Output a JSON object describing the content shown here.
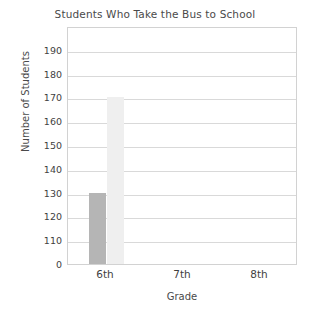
{
  "chart_data": {
    "type": "bar",
    "title": "Students Who Take the Bus to School",
    "xlabel": "Grade",
    "ylabel": "Number of Students",
    "categories": [
      "6th",
      "7th",
      "8th"
    ],
    "series": [
      {
        "name": "series-1",
        "color": "#b5b5b5",
        "values": [
          130,
          0,
          0
        ]
      },
      {
        "name": "series-2",
        "color": "#efefef",
        "values": [
          170,
          0,
          0
        ]
      }
    ],
    "ytick_labels": [
      "190",
      "180",
      "170",
      "160",
      "150",
      "140",
      "130",
      "120",
      "110",
      "0"
    ],
    "ytick_values": [
      190,
      180,
      170,
      160,
      150,
      140,
      130,
      120,
      110,
      0
    ],
    "ylim": [
      100,
      200
    ],
    "grid": "horizontal",
    "legend": "none",
    "axis_note": "value axis breaks between 110 and 0"
  },
  "colors": {
    "frame": "#d2d2d2",
    "gridline": "#d9d9d9",
    "text": "#3f3f3f",
    "background": "#ffffff"
  }
}
